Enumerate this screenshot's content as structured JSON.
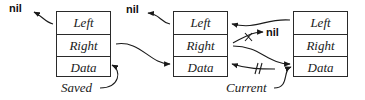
{
  "diagram": {
    "type": "doubly-linked-list",
    "nodes": [
      {
        "id": "node1",
        "fields": {
          "left": "Left",
          "right": "Right",
          "data": "Data"
        }
      },
      {
        "id": "node2",
        "fields": {
          "left": "Left",
          "right": "Right",
          "data": "Data"
        }
      },
      {
        "id": "node3",
        "fields": {
          "left": "Left",
          "right": "Right",
          "data": "Data"
        }
      }
    ],
    "nil_labels": [
      "nil",
      "nil",
      "nil"
    ],
    "variables": {
      "saved": "Saved",
      "current": "Current"
    },
    "edges": [
      {
        "from": "node1.Left",
        "to": "nil",
        "style": "normal"
      },
      {
        "from": "node1.Right",
        "to": "node2.Data",
        "style": "normal"
      },
      {
        "from": "Saved",
        "to": "node1.Data",
        "style": "normal"
      },
      {
        "from": "node2.Left",
        "to": "nil",
        "style": "normal"
      },
      {
        "from": "node3.Left",
        "to": "node2.Left",
        "style": "normal"
      },
      {
        "from": "node2.Right",
        "to": "nil",
        "style": "crossed-out-x"
      },
      {
        "from": "node2.Right",
        "to": "node3.Data",
        "style": "normal"
      },
      {
        "from": "Current",
        "to": "node2.Data",
        "style": "crossed-out-double-slash"
      },
      {
        "from": "Current",
        "to": "node3.Data",
        "style": "normal"
      }
    ],
    "colors": {
      "ink": "#1a1a1a",
      "background": "#ffffff"
    }
  }
}
